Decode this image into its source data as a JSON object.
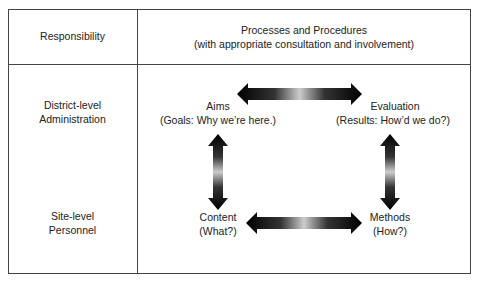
{
  "header": {
    "col1": "Responsibility",
    "col2_line1": "Processes and Procedures",
    "col2_line2": "(with appropriate consultation and involvement)"
  },
  "rows": [
    {
      "line1": "District-level",
      "line2": "Administration"
    },
    {
      "line1": "Site-level",
      "line2": "Personnel"
    }
  ],
  "nodes": {
    "aims": {
      "label": "Aims",
      "sub": "(Goals: Why we’re here.)"
    },
    "evaluation": {
      "label": "Evaluation",
      "sub": "(Results: How’d we do?)"
    },
    "content": {
      "label": "Content",
      "sub": "(What?)"
    },
    "methods": {
      "label": "Methods",
      "sub": "(How?)"
    }
  },
  "arrows": [
    {
      "from": "aims",
      "to": "evaluation",
      "type": "bidirectional"
    },
    {
      "from": "aims",
      "to": "content",
      "type": "bidirectional"
    },
    {
      "from": "evaluation",
      "to": "methods",
      "type": "bidirectional"
    },
    {
      "from": "content",
      "to": "methods",
      "type": "bidirectional"
    }
  ]
}
